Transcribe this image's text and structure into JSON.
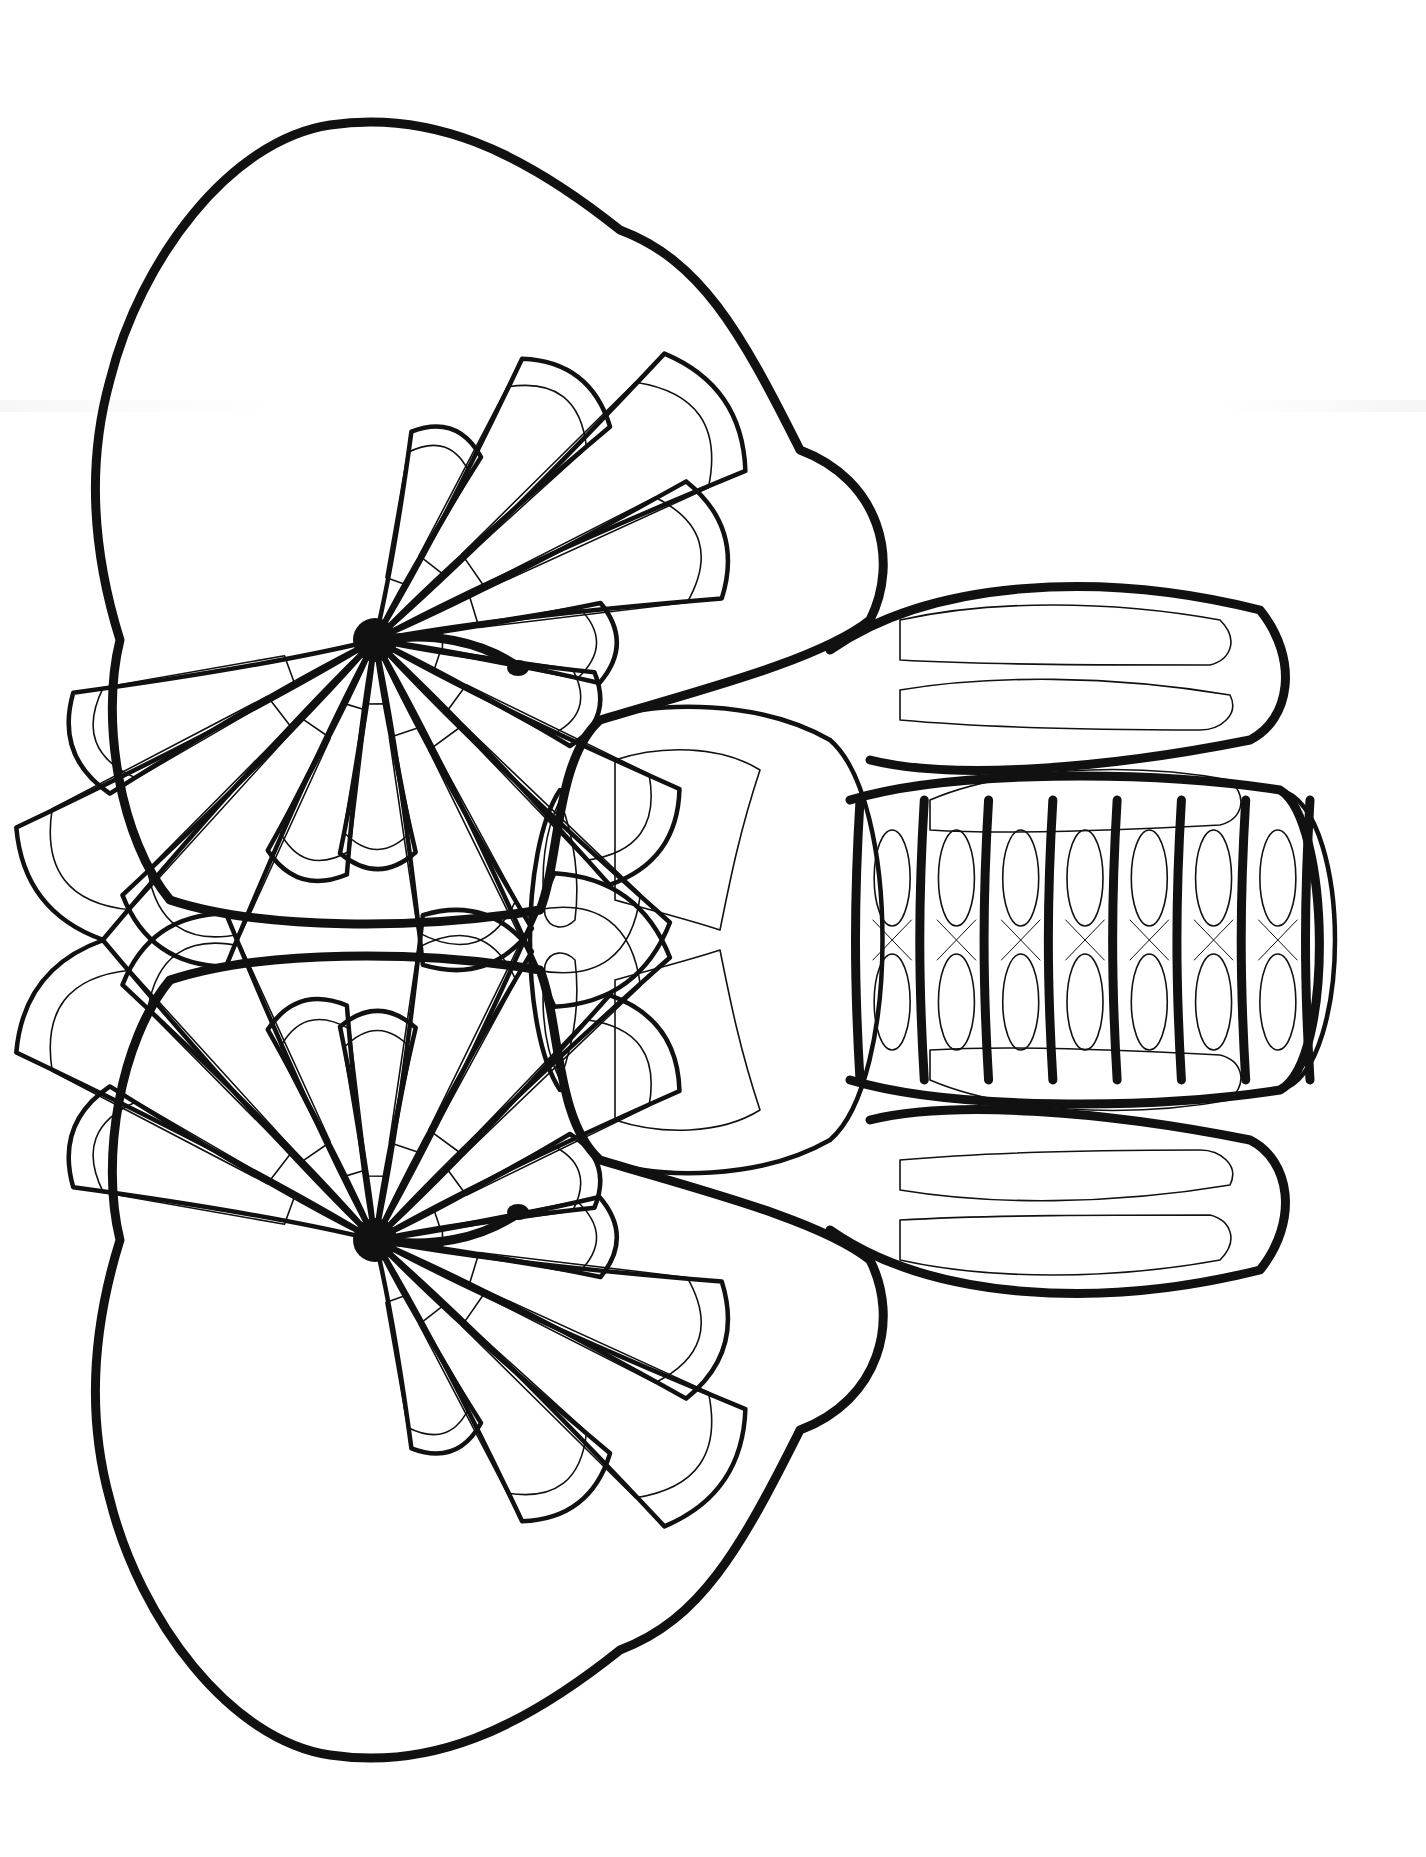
{
  "illustration": {
    "subject": "Zentangle elephant head coloring page",
    "orientation": "rotated 90 degrees, trunk pointing right",
    "style": "black line art on white, ornamental patterns",
    "colors": {
      "background": "#ffffff",
      "ink": "#111111"
    },
    "parts": {
      "top_ear": {
        "hub": [
          375,
          640
        ],
        "eye": [
          515,
          668
        ],
        "petal_count": 14,
        "radius": 430
      },
      "bottom_ear": {
        "hub": [
          375,
          1240
        ],
        "eye": [
          515,
          1212
        ],
        "petal_count": 14,
        "radius": 430
      },
      "forehead": {
        "center": [
          700,
          940
        ]
      },
      "trunk": {
        "start_x": 820,
        "tip_x": 1330,
        "center_y": 940,
        "segments": 7
      },
      "tusk_upper": {
        "y": 720
      },
      "tusk_lower": {
        "y": 1160
      }
    },
    "patterns": [
      "diamond chain",
      "ladder/brick",
      "chevron feather",
      "wavy hatch",
      "scallop"
    ]
  }
}
